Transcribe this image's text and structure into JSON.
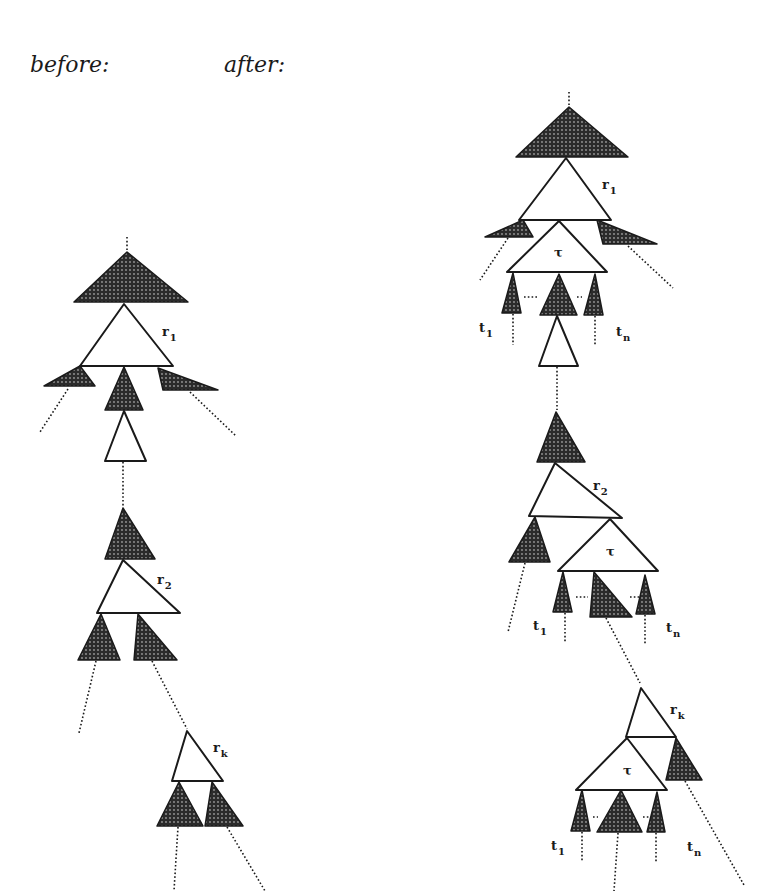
{
  "headings": {
    "before": "before:",
    "after": "after:"
  },
  "colors": {
    "stroke": "#1a1a1a",
    "shade_dark": "#2b2b2b",
    "shade_dot": "#9a9a9a",
    "white": "#ffffff"
  },
  "panels": {
    "before": {
      "shaded": [
        [
          [
            127,
            252
          ],
          [
            74,
            302
          ],
          [
            188,
            302
          ]
        ],
        [
          [
            80,
            366
          ],
          [
            44,
            386
          ],
          [
            95,
            386
          ]
        ],
        [
          [
            124,
            367
          ],
          [
            105,
            410
          ],
          [
            143,
            410
          ]
        ],
        [
          [
            158,
            368
          ],
          [
            163,
            390
          ],
          [
            218,
            390
          ]
        ],
        [
          [
            123,
            508
          ],
          [
            105,
            559
          ],
          [
            155,
            559
          ]
        ],
        [
          [
            101,
            614
          ],
          [
            78,
            660
          ],
          [
            120,
            660
          ]
        ],
        [
          [
            138,
            614
          ],
          [
            134,
            660
          ],
          [
            177,
            660
          ]
        ],
        [
          [
            179,
            782
          ],
          [
            157,
            826
          ],
          [
            203,
            826
          ]
        ],
        [
          [
            212,
            782
          ],
          [
            205,
            826
          ],
          [
            243,
            826
          ]
        ]
      ],
      "white": [
        [
          [
            124,
            304
          ],
          [
            80,
            366
          ],
          [
            173,
            366
          ]
        ],
        [
          [
            124,
            411
          ],
          [
            105,
            461
          ],
          [
            146,
            461
          ]
        ],
        [
          [
            123,
            560
          ],
          [
            97,
            613
          ],
          [
            180,
            613
          ]
        ],
        [
          [
            187,
            731
          ],
          [
            172,
            781
          ],
          [
            223,
            781
          ]
        ]
      ],
      "dotted": [
        [
          [
            127,
            237
          ],
          [
            127,
            252
          ]
        ],
        [
          [
            68,
            389
          ],
          [
            40,
            432
          ]
        ],
        [
          [
            190,
            392
          ],
          [
            236,
            436
          ]
        ],
        [
          [
            123,
            462
          ],
          [
            123,
            506
          ]
        ],
        [
          [
            96,
            661
          ],
          [
            79,
            733
          ]
        ],
        [
          [
            152,
            661
          ],
          [
            187,
            729
          ]
        ],
        [
          [
            178,
            827
          ],
          [
            174,
            891
          ]
        ],
        [
          [
            227,
            827
          ],
          [
            265,
            891
          ]
        ]
      ],
      "labels": [
        {
          "text": "r",
          "sub": "1",
          "x": 162,
          "y": 336
        },
        {
          "text": "r",
          "sub": "2",
          "x": 157,
          "y": 584
        },
        {
          "text": "r",
          "sub": "k",
          "x": 213,
          "y": 752
        }
      ]
    },
    "after": {
      "shaded": [
        [
          [
            569,
            107
          ],
          [
            516,
            157
          ],
          [
            628,
            157
          ]
        ],
        [
          [
            523,
            220
          ],
          [
            485,
            237
          ],
          [
            533,
            237
          ]
        ],
        [
          [
            597,
            220
          ],
          [
            603,
            244
          ],
          [
            657,
            244
          ]
        ],
        [
          [
            513,
            273
          ],
          [
            502,
            313
          ],
          [
            521,
            313
          ]
        ],
        [
          [
            559,
            274
          ],
          [
            540,
            315
          ],
          [
            577,
            315
          ]
        ],
        [
          [
            595,
            274
          ],
          [
            584,
            315
          ],
          [
            603,
            315
          ]
        ],
        [
          [
            556,
            412
          ],
          [
            537,
            462
          ],
          [
            585,
            462
          ]
        ],
        [
          [
            535,
            517
          ],
          [
            509,
            562
          ],
          [
            550,
            562
          ]
        ],
        [
          [
            563,
            572
          ],
          [
            553,
            612
          ],
          [
            572,
            612
          ]
        ],
        [
          [
            594,
            572
          ],
          [
            590,
            617
          ],
          [
            632,
            617
          ]
        ],
        [
          [
            645,
            575
          ],
          [
            636,
            614
          ],
          [
            655,
            614
          ]
        ],
        [
          [
            676,
            738
          ],
          [
            666,
            780
          ],
          [
            702,
            780
          ]
        ],
        [
          [
            582,
            790
          ],
          [
            571,
            831
          ],
          [
            590,
            831
          ]
        ],
        [
          [
            621,
            790
          ],
          [
            597,
            832
          ],
          [
            642,
            832
          ]
        ],
        [
          [
            657,
            792
          ],
          [
            647,
            832
          ],
          [
            665,
            832
          ]
        ]
      ],
      "white": [
        [
          [
            566,
            158
          ],
          [
            519,
            220
          ],
          [
            611,
            220
          ]
        ],
        [
          [
            559,
            221
          ],
          [
            507,
            272
          ],
          [
            607,
            272
          ]
        ],
        [
          [
            557,
            316
          ],
          [
            539,
            366
          ],
          [
            578,
            366
          ]
        ],
        [
          [
            555,
            463
          ],
          [
            529,
            516
          ],
          [
            622,
            518
          ]
        ],
        [
          [
            610,
            519
          ],
          [
            558,
            571
          ],
          [
            658,
            571
          ]
        ],
        [
          [
            641,
            688
          ],
          [
            626,
            737
          ],
          [
            676,
            737
          ]
        ],
        [
          [
            627,
            738
          ],
          [
            576,
            790
          ],
          [
            667,
            790
          ]
        ]
      ],
      "dotted": [
        [
          [
            569,
            92
          ],
          [
            569,
            107
          ]
        ],
        [
          [
            508,
            238
          ],
          [
            480,
            280
          ]
        ],
        [
          [
            628,
            246
          ],
          [
            673,
            288
          ]
        ],
        [
          [
            513,
            314
          ],
          [
            513,
            345
          ]
        ],
        [
          [
            595,
            316
          ],
          [
            595,
            346
          ]
        ],
        [
          [
            524,
            297
          ],
          [
            538,
            297
          ]
        ],
        [
          [
            577,
            297
          ],
          [
            582,
            297
          ]
        ],
        [
          [
            557,
            367
          ],
          [
            557,
            410
          ]
        ],
        [
          [
            525,
            563
          ],
          [
            508,
            632
          ]
        ],
        [
          [
            565,
            613
          ],
          [
            565,
            643
          ]
        ],
        [
          [
            645,
            615
          ],
          [
            645,
            644
          ]
        ],
        [
          [
            576,
            597
          ],
          [
            588,
            597
          ]
        ],
        [
          [
            630,
            597
          ],
          [
            641,
            597
          ]
        ],
        [
          [
            606,
            618
          ],
          [
            640,
            683
          ]
        ],
        [
          [
            685,
            781
          ],
          [
            744,
            885
          ]
        ],
        [
          [
            582,
            832
          ],
          [
            582,
            862
          ]
        ],
        [
          [
            618,
            833
          ],
          [
            614,
            891
          ]
        ],
        [
          [
            656,
            833
          ],
          [
            656,
            862
          ]
        ],
        [
          [
            593,
            817
          ],
          [
            598,
            817
          ]
        ],
        [
          [
            643,
            817
          ],
          [
            649,
            817
          ]
        ]
      ],
      "labels": [
        {
          "text": "r",
          "sub": "1",
          "x": 602,
          "y": 189
        },
        {
          "text": "τ",
          "sub": "",
          "x": 554,
          "y": 257
        },
        {
          "text": "t",
          "sub": "1",
          "x": 479,
          "y": 332
        },
        {
          "text": "t",
          "sub": "n",
          "x": 616,
          "y": 336
        },
        {
          "text": "r",
          "sub": "2",
          "x": 593,
          "y": 490
        },
        {
          "text": "τ",
          "sub": "",
          "x": 606,
          "y": 556
        },
        {
          "text": "t",
          "sub": "1",
          "x": 533,
          "y": 630
        },
        {
          "text": "t",
          "sub": "n",
          "x": 666,
          "y": 632
        },
        {
          "text": "r",
          "sub": "k",
          "x": 670,
          "y": 714
        },
        {
          "text": "τ",
          "sub": "",
          "x": 623,
          "y": 775
        },
        {
          "text": "t",
          "sub": "1",
          "x": 551,
          "y": 850
        },
        {
          "text": "t",
          "sub": "n",
          "x": 687,
          "y": 851
        }
      ]
    }
  }
}
